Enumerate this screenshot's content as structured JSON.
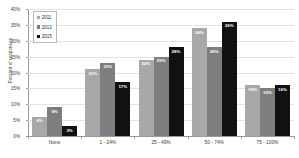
{
  "chart_data": {
    "type": "bar",
    "title": "",
    "xlabel": "",
    "ylabel": "Percent of responses",
    "ylim": [
      0,
      40
    ],
    "ytick_labels": [
      "40%",
      "35%",
      "30%",
      "25%",
      "20%",
      "15%",
      "10%",
      "5%",
      "0%"
    ],
    "ytick_values": [
      40,
      35,
      30,
      25,
      20,
      15,
      10,
      5,
      0
    ],
    "grid": true,
    "legend_position": "upper-left-inside",
    "categories": [
      "None",
      "1 - 24%",
      "25 - 49%",
      "50 - 74%",
      "75 - 100%"
    ],
    "series": [
      {
        "name": "2011",
        "color": "#a8a8a8",
        "values": [
          6,
          21,
          24,
          34,
          16
        ],
        "labels": [
          "6%",
          "21%",
          "24%",
          "34%",
          "16%"
        ]
      },
      {
        "name": "2013",
        "color": "#7e7e7e",
        "values": [
          9,
          23,
          25,
          28,
          15
        ],
        "labels": [
          "9%",
          "23%",
          "25%",
          "28%",
          "15%"
        ]
      },
      {
        "name": "2015",
        "color": "#111111",
        "values": [
          3,
          17,
          28,
          36,
          16
        ],
        "labels": [
          "3%",
          "17%",
          "28%",
          "36%",
          "16%"
        ]
      }
    ]
  },
  "legend": {
    "items": [
      {
        "label": "2011",
        "color": "#a8a8a8"
      },
      {
        "label": "2013",
        "color": "#7e7e7e"
      },
      {
        "label": "2015",
        "color": "#111111"
      }
    ]
  }
}
